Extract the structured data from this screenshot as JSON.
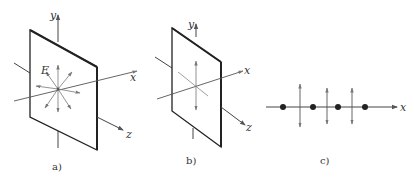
{
  "figure": {
    "panels": [
      {
        "id": "a",
        "caption": "a)",
        "axis_labels": {
          "x": "x",
          "y": "y",
          "z": "z"
        },
        "field_label": "E",
        "description": "Unpolarized wave: E vectors in all directions in plane"
      },
      {
        "id": "b",
        "caption": "b)",
        "axis_labels": {
          "x": "x",
          "y": "y",
          "z": "z"
        },
        "description": "Linearly polarized wave: E vector along y"
      },
      {
        "id": "c",
        "caption": "c)",
        "axis_labels": {
          "x": "x"
        },
        "description": "Dots and vertical arrows along x-axis"
      }
    ],
    "colors": {
      "line": "#333333",
      "plate": "#222222",
      "arrow": "#777777"
    }
  }
}
